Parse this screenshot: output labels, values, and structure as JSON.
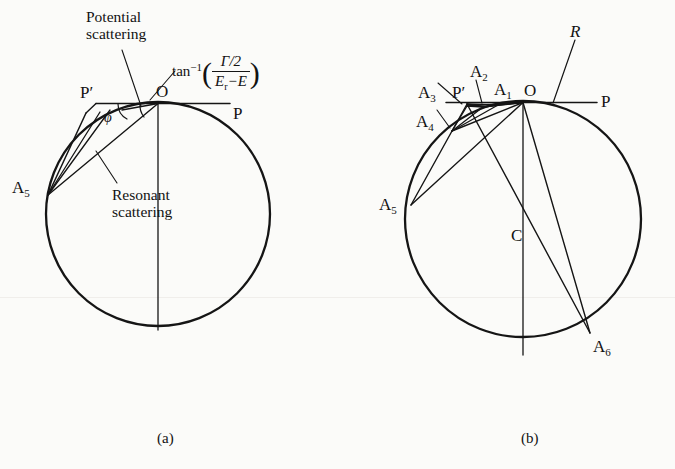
{
  "figure": {
    "title_domain": "Argand diagram of resonance scattering",
    "background_color": "#fbfbf9",
    "ink_color": "#151515"
  },
  "panel_a": {
    "caption": "(a)",
    "points": {
      "O": "O",
      "P": "P",
      "P_prime": "P′",
      "A5": "A",
      "A5_sub": "5"
    },
    "angle_label": "φ",
    "annotations": {
      "potential_line1": "Potential",
      "potential_line2": "scattering",
      "resonant_line1": "Resonant",
      "resonant_line2": "scattering"
    },
    "formula": {
      "fn": "tan",
      "exponent": "−1",
      "numerator": "Γ/2",
      "denominator_1": "E",
      "denominator_sub": "r",
      "denominator_2": "−E",
      "open_paren": "(",
      "close_paren": ")"
    }
  },
  "panel_b": {
    "caption": "(b)",
    "radius_label": "R",
    "points": [
      {
        "name": "O",
        "base": "O",
        "sub": ""
      },
      {
        "name": "P",
        "base": "P",
        "sub": ""
      },
      {
        "name": "Pp",
        "base": "P′",
        "sub": ""
      },
      {
        "name": "C",
        "base": "C",
        "sub": ""
      },
      {
        "name": "A1",
        "base": "A",
        "sub": "1"
      },
      {
        "name": "A2",
        "base": "A",
        "sub": "2"
      },
      {
        "name": "A3",
        "base": "A",
        "sub": "3"
      },
      {
        "name": "A4",
        "base": "A",
        "sub": "4"
      },
      {
        "name": "A5",
        "base": "A",
        "sub": "5"
      },
      {
        "name": "A6",
        "base": "A",
        "sub": "6"
      }
    ]
  }
}
